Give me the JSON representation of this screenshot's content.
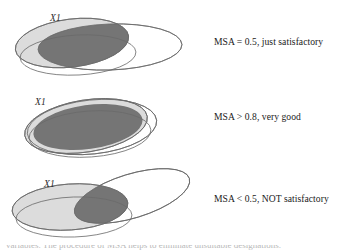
{
  "figure": {
    "colors": {
      "light_fill": "#d9d9d9",
      "dark_overlap_fill": "#6f6f6f",
      "outline_stroke": "#6a6a6a",
      "text": "#1a1a1a",
      "background": "#ffffff"
    },
    "rows": [
      {
        "id": "row-1",
        "variable_label": "X1",
        "caption": "MSA = 0.5, just satisfactory",
        "overlap_description": "moderate overlap"
      },
      {
        "id": "row-2",
        "variable_label": "X1",
        "caption": "MSA > 0.8, very good",
        "overlap_description": "near-total overlap"
      },
      {
        "id": "row-3",
        "variable_label": "X1",
        "caption": "MSA < 0.5, NOT satisfactory",
        "overlap_description": "small overlap"
      }
    ],
    "bottom_caption_partial": "variables. The procedure of MSA helps to eliminate unsuitable designations."
  }
}
